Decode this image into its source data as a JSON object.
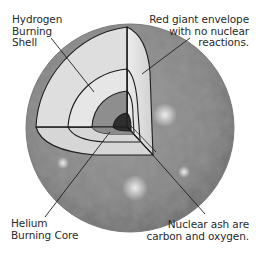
{
  "diagram": {
    "title": "",
    "labels": {
      "hydrogen_shell": "Hydrogen\nBurning\nShell",
      "envelope": "Red giant envelope\nwith no nuclear\nreactions.",
      "helium_core": "Helium\nBurning Core",
      "nuclear_ash": "Nuclear ash are\ncarbon and oxygen."
    },
    "layers": [
      {
        "name": "Red giant envelope",
        "color": "#8a8a8a"
      },
      {
        "name": "Outer cut shell",
        "color": "#d4d4d4"
      },
      {
        "name": "Hydrogen burning shell",
        "color": "#e2e2e2"
      },
      {
        "name": "Helium burning core",
        "color": "#8e8e8e"
      },
      {
        "name": "Carbon/oxygen ash core",
        "color": "#2e2e2e"
      }
    ],
    "colors": {
      "outline": "#1e1e1e",
      "text": "#2a2a2a",
      "background": "#ffffff"
    }
  }
}
